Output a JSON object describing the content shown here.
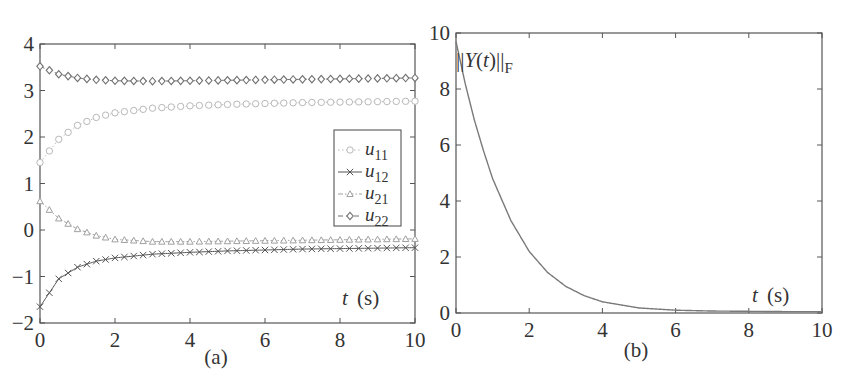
{
  "chart_data": [
    {
      "id": "a",
      "type": "line",
      "caption": "(a)",
      "title": "",
      "xlabel": "t (s)",
      "xlabel_italic_part": "t",
      "xlabel_unit": "(s)",
      "ylabel": "",
      "xlim": [
        0,
        10
      ],
      "ylim": [
        -2,
        4
      ],
      "xticks": [
        "0",
        "2",
        "4",
        "6",
        "8",
        "10"
      ],
      "yticks": [
        "-2",
        "-1",
        "0",
        "1",
        "2",
        "3",
        "4"
      ],
      "grid": false,
      "legend_position": "right-center",
      "x": [
        0,
        0.5,
        1,
        1.5,
        2,
        3,
        4,
        5,
        6,
        7,
        8,
        9,
        10
      ],
      "series": [
        {
          "name": "u11",
          "label_base": "u",
          "label_sub": "11",
          "marker": "circle",
          "line": "dotted",
          "color": "#b8b8b8",
          "values": [
            1.45,
            1.95,
            2.25,
            2.42,
            2.52,
            2.62,
            2.67,
            2.7,
            2.72,
            2.74,
            2.75,
            2.76,
            2.77
          ]
        },
        {
          "name": "u12",
          "label_base": "u",
          "label_sub": "12",
          "marker": "x",
          "line": "solid",
          "color": "#555555",
          "values": [
            -1.65,
            -1.05,
            -0.8,
            -0.67,
            -0.6,
            -0.52,
            -0.48,
            -0.45,
            -0.43,
            -0.41,
            -0.4,
            -0.39,
            -0.38
          ]
        },
        {
          "name": "u21",
          "label_base": "u",
          "label_sub": "21",
          "marker": "triangle",
          "line": "dashdot",
          "color": "#a0a0a0",
          "values": [
            0.62,
            0.25,
            0.02,
            -0.12,
            -0.2,
            -0.25,
            -0.25,
            -0.24,
            -0.23,
            -0.22,
            -0.21,
            -0.2,
            -0.19
          ]
        },
        {
          "name": "u22",
          "label_base": "u",
          "label_sub": "22",
          "marker": "diamond",
          "line": "dashed",
          "color": "#707070",
          "values": [
            3.52,
            3.35,
            3.27,
            3.23,
            3.21,
            3.2,
            3.21,
            3.22,
            3.23,
            3.24,
            3.25,
            3.26,
            3.27
          ]
        }
      ]
    },
    {
      "id": "b",
      "type": "line",
      "caption": "(b)",
      "title": "",
      "annotation": "||Y(t)||F",
      "annotation_parts": {
        "bars_left": "||",
        "Y": "Y",
        "paren_open": "(",
        "t": "t",
        "paren_close": ")",
        "bars_right": "||",
        "sub": "F"
      },
      "xlabel": "t (s)",
      "xlabel_italic_part": "t",
      "xlabel_unit": "(s)",
      "ylabel": "",
      "xlim": [
        0,
        10
      ],
      "ylim": [
        0,
        10
      ],
      "xticks": [
        "0",
        "2",
        "4",
        "6",
        "8",
        "10"
      ],
      "yticks": [
        "0",
        "2",
        "4",
        "6",
        "8",
        "10"
      ],
      "grid": false,
      "x": [
        0,
        0.25,
        0.5,
        0.75,
        1,
        1.5,
        2,
        2.5,
        3,
        3.5,
        4,
        5,
        6,
        7,
        8,
        9,
        10
      ],
      "series": [
        {
          "name": "||Y(t)||F",
          "color": "#7a7a7a",
          "values": [
            9.7,
            8.2,
            6.9,
            5.8,
            4.8,
            3.3,
            2.2,
            1.45,
            0.95,
            0.62,
            0.4,
            0.18,
            0.1,
            0.07,
            0.06,
            0.05,
            0.05
          ]
        }
      ]
    }
  ]
}
